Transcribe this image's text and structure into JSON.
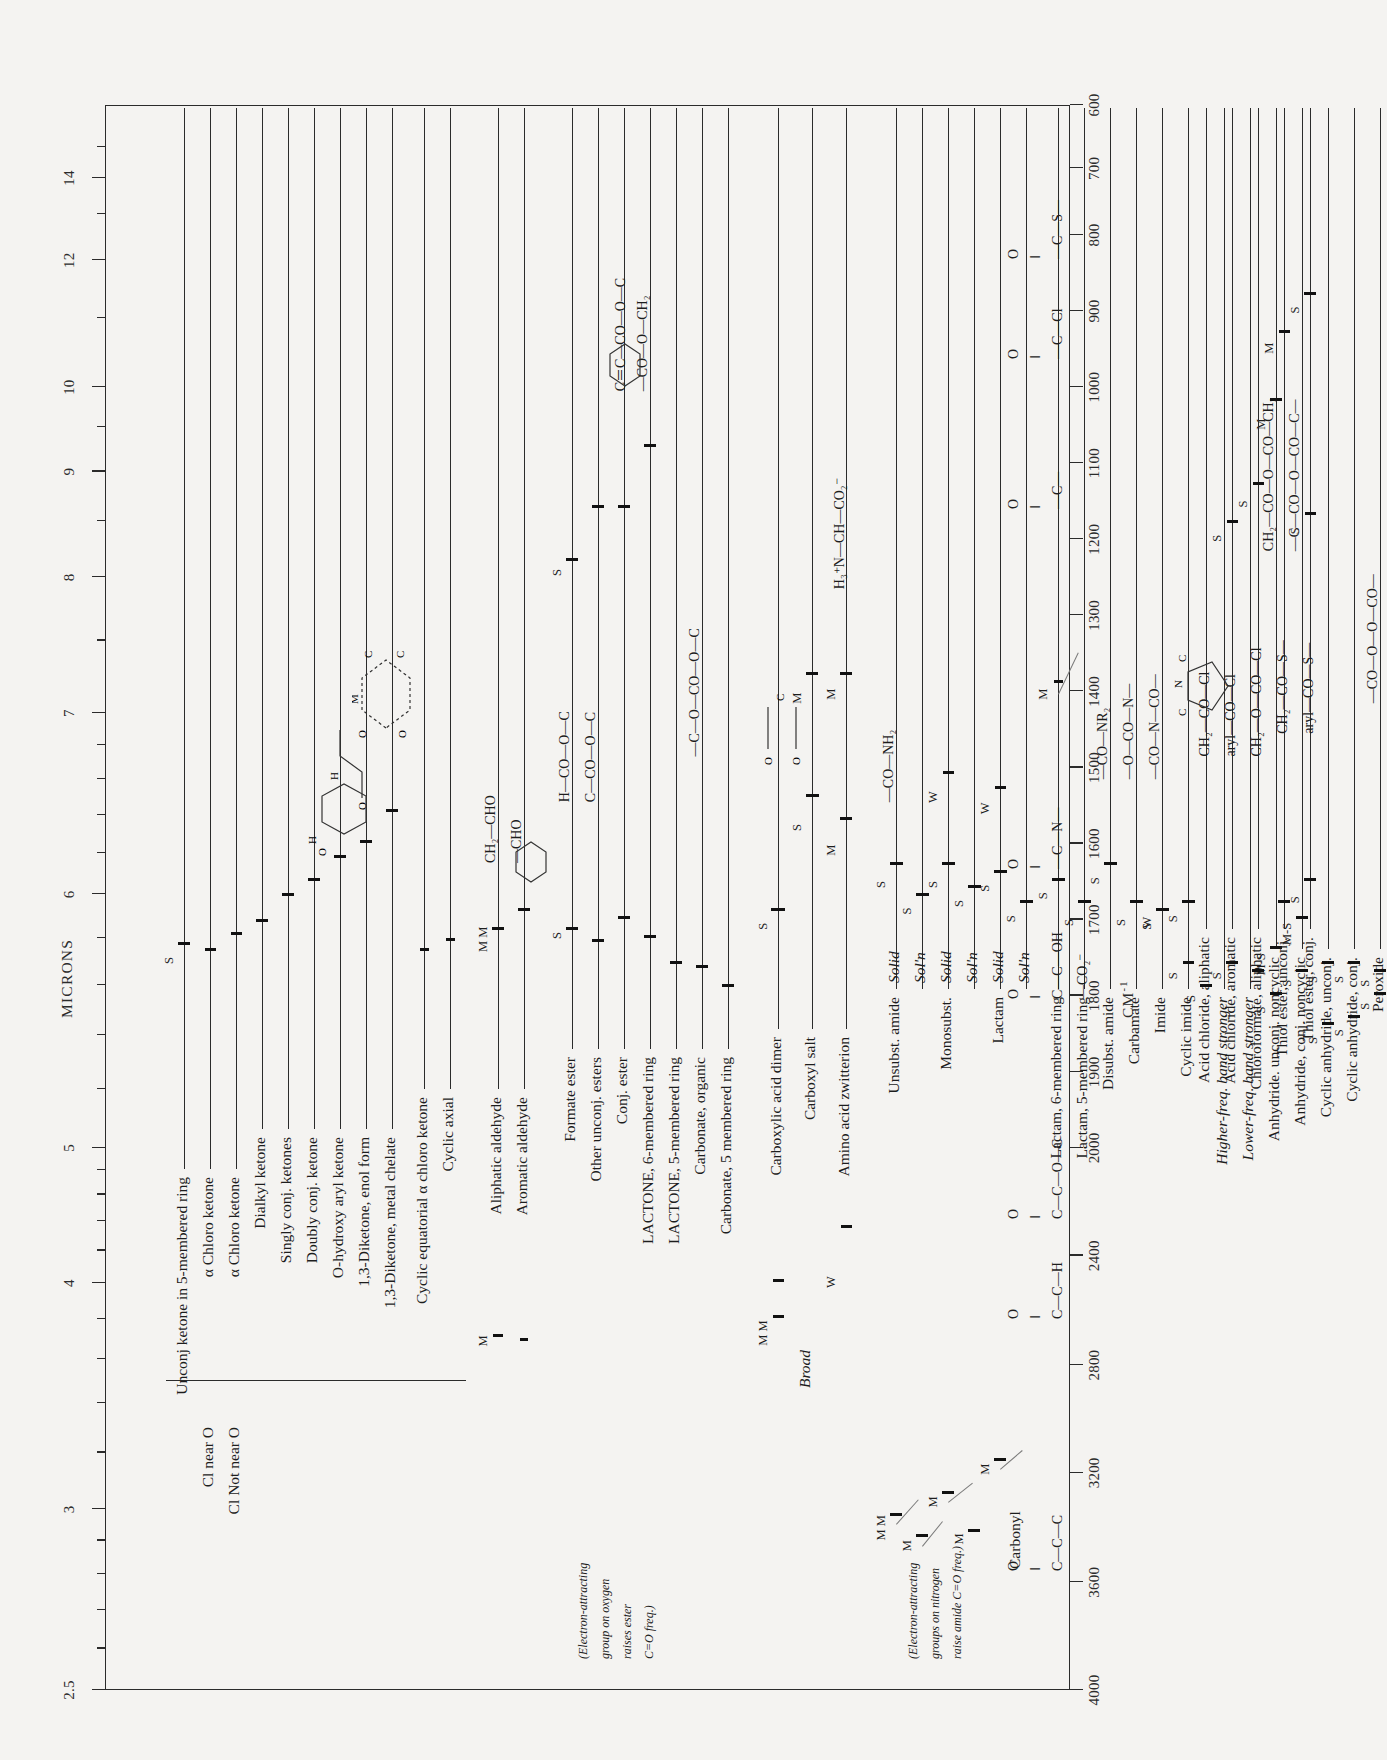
{
  "chart_data": {
    "type": "table",
    "xlabel": "CM⁻¹",
    "ylabel": "MICRONS",
    "grid": false,
    "legend": "none",
    "axes": {
      "microns": {
        "label": "MICRONS",
        "ticks": [
          "2.5",
          "3",
          "4",
          "5",
          "6",
          "7",
          "8",
          "9",
          "10",
          "12",
          "14"
        ]
      },
      "wavenumber": {
        "label": "CM⁻¹",
        "ticks": [
          "4000",
          "3600",
          "3200",
          "2800",
          "2400",
          "2000",
          "1900",
          "1800",
          "1700",
          "1600",
          "1500",
          "1400",
          "1300",
          "1200",
          "1100",
          "1000",
          "900",
          "800",
          "700",
          "600"
        ]
      }
    },
    "groups": [
      {
        "name": "ketone",
        "formula_lines": [
          "Carbonyl",
          "O",
          "‖",
          "C—C—C"
        ],
        "rows": [
          {
            "label": "Unconj ketone in 5-membered ring",
            "bands": [
              {
                "cm": 1745,
                "intensity": "S"
              }
            ]
          },
          {
            "label": "α Chloro ketone",
            "sub": "Cl near O",
            "bands": [
              {
                "cm": 1745,
                "intensity": ""
              }
            ]
          },
          {
            "label": "α Chloro ketone",
            "sub": "Cl Not near O",
            "bands": [
              {
                "cm": 1725,
                "intensity": ""
              }
            ]
          },
          {
            "label": "Dialkyl ketone",
            "bands": [
              {
                "cm": 1715,
                "intensity": ""
              }
            ]
          },
          {
            "label": "Singly conj. ketones",
            "bands": [
              {
                "cm": 1685,
                "intensity": ""
              }
            ]
          },
          {
            "label": "Doubly conj. ketone",
            "bands": [
              {
                "cm": 1665,
                "intensity": ""
              }
            ]
          },
          {
            "label": "O-hydroxy aryl ketone",
            "bands": [
              {
                "cm": 1640,
                "intensity": ""
              }
            ]
          },
          {
            "label": "1,3-Diketone, enol form",
            "bands": [
              {
                "cm": 1620,
                "intensity": ""
              }
            ]
          },
          {
            "label": "1,3-Diketone, metal chelate",
            "bands": [
              {
                "cm": 1590,
                "intensity": ""
              }
            ]
          },
          {
            "label": "Cyclic equatorial α chloro ketone",
            "bands": []
          },
          {
            "label": "Cyclic axial",
            "bands": []
          }
        ]
      },
      {
        "name": "aldehyde",
        "formula_lines": [
          "O",
          "‖",
          "C—C—H"
        ],
        "rows": [
          {
            "label": "Aliphatic aldehyde",
            "bands": [
              {
                "cm": 1725,
                "intensity": "M M"
              }
            ],
            "extra": "CH₂—CHO"
          },
          {
            "label": "Aromatic aldehyde",
            "bands": [
              {
                "cm": 1700,
                "intensity": ""
              }
            ],
            "extra": "—CHO"
          }
        ]
      },
      {
        "name": "ester",
        "formula_lines": [
          "O",
          "‖",
          "C—C—O—C"
        ],
        "note": "(Electron-attracting group on oxygen raises ester C=O freq.)",
        "rows": [
          {
            "label": "Formate ester",
            "bands": [
              {
                "cm": 1720,
                "intensity": "S"
              }
            ],
            "extra": "H—CO—O—C"
          },
          {
            "label": "Other unconj. esters",
            "bands": [
              {
                "cm": 1740,
                "intensity": ""
              }
            ],
            "extra": "C—CO—O—C"
          },
          {
            "label": "Conj. ester",
            "bands": [
              {
                "cm": 1715,
                "intensity": ""
              }
            ]
          },
          {
            "label": "LACTONE, 6-membered ring",
            "bands": [
              {
                "cm": 1735,
                "intensity": ""
              }
            ]
          },
          {
            "label": "LACTONE, 5-membered ring",
            "bands": [
              {
                "cm": 1770,
                "intensity": ""
              }
            ]
          },
          {
            "label": "Carbonate, organic",
            "bands": [
              {
                "cm": 1780,
                "intensity": ""
              }
            ],
            "extra": "—C—O—CO—O—C"
          },
          {
            "label": "Carbonate, 5 membered ring",
            "bands": [
              {
                "cm": 1800,
                "intensity": ""
              }
            ]
          },
          {
            "label": "Acetate ester C—O",
            "bands": [
              {
                "cm": 1240,
                "intensity": "S"
              }
            ]
          },
          {
            "label": "Other unconj. esters",
            "bands": [
              {
                "cm": 1190,
                "intensity": ""
              }
            ]
          },
          {
            "label": "α,β-Unsat. ester",
            "bands": [
              {
                "cm": 1180,
                "intensity": ""
              }
            ],
            "extra": "C＝C—CO—O—C"
          },
          {
            "label": "Arom. ester",
            "bands": [
              {
                "cm": 1100,
                "intensity": ""
              }
            ],
            "extra": "—CO—O—CH₂"
          }
        ]
      },
      {
        "name": "carboxylic-acid",
        "formula_lines": [
          "O",
          "‖",
          "C—C—OH",
          "—CO₂⁻"
        ],
        "rows": [
          {
            "label": "Carboxylic acid dimer",
            "bands": [
              {
                "cm": 1710,
                "intensity": "S"
              },
              {
                "cm": 2600,
                "intensity": "M M"
              },
              {
                "cm": 2900,
                "intensity": "S"
              }
            ],
            "notes": [
              "Broad"
            ]
          },
          {
            "label": "Carboxyl salt",
            "bands": [
              {
                "cm": 1580,
                "intensity": "S"
              },
              {
                "cm": 1400,
                "intensity": "M"
              }
            ]
          },
          {
            "label": "Amino acid zwitterion",
            "bands": [
              {
                "cm": 1600,
                "intensity": "M"
              },
              {
                "cm": 1400,
                "intensity": "M"
              },
              {
                "cm": 2100,
                "intensity": "W"
              }
            ],
            "extra": "H₃⁺N—CH—CO₂⁻"
          }
        ]
      },
      {
        "name": "amide",
        "formula_lines": [
          "O",
          "‖",
          "—C—N—"
        ],
        "note": "(Electron-attracting groups on nitrogen raise amide C=O freq.)",
        "rows": [
          {
            "label": "Unsubst. amide",
            "state": "Solid",
            "bands": [
              {
                "cm": 1650,
                "intensity": "S"
              },
              {
                "cm": 3350,
                "intensity": "M M"
              }
            ],
            "extra": "—CO—NH₂"
          },
          {
            "label": "Unsubst. amide",
            "state": "Sol'n",
            "bands": [
              {
                "cm": 1690,
                "intensity": "S"
              },
              {
                "cm": 3450,
                "intensity": "M"
              }
            ]
          },
          {
            "label": "Monosubst.",
            "state": "Solid",
            "bands": [
              {
                "cm": 1650,
                "intensity": "S"
              },
              {
                "cm": 3300,
                "intensity": "M"
              },
              {
                "cm": 1550,
                "intensity": "W"
              }
            ]
          },
          {
            "label": "Monosubst.",
            "state": "Sol'n",
            "bands": [
              {
                "cm": 1680,
                "intensity": "S"
              },
              {
                "cm": 3440,
                "intensity": "M"
              }
            ]
          },
          {
            "label": "Lactam (cyclic)",
            "state": "Solid",
            "bands": [
              {
                "cm": 1660,
                "intensity": "S"
              },
              {
                "cm": 3200,
                "intensity": "M"
              }
            ]
          },
          {
            "label": "Lactam (cyclic)",
            "state": "Sol'n",
            "bands": [
              {
                "cm": 1700,
                "intensity": "S"
              }
            ]
          },
          {
            "label": "Lactam, 6-membered ring",
            "bands": [
              {
                "cm": 1670,
                "intensity": "S"
              }
            ]
          },
          {
            "label": "Lactam, 5-membered ring",
            "bands": [
              {
                "cm": 1700,
                "intensity": "S"
              }
            ]
          },
          {
            "label": "Disubst. amide",
            "bands": [
              {
                "cm": 1650,
                "intensity": "S"
              }
            ],
            "extra": "—CO—NR₂"
          },
          {
            "label": "Carbamate",
            "bands": [
              {
                "cm": 1700,
                "intensity": "S"
              }
            ],
            "extra": "—O—CO—N—"
          },
          {
            "label": "Imide",
            "bands": [
              {
                "cm": 1710,
                "intensity": "S"
              },
              {
                "cm": 1700,
                "intensity": "W"
              }
            ],
            "extra": "—CO—N—CO—"
          },
          {
            "label": "Cyclic imide",
            "bands": [
              {
                "cm": 1700,
                "intensity": "S"
              },
              {
                "cm": 1770,
                "intensity": "S"
              }
            ]
          },
          {
            "label": "Higher-freq. band stronger",
            "italic": true,
            "bands": []
          },
          {
            "label": "Lower-freq. band stronger",
            "italic": true,
            "bands": []
          }
        ]
      },
      {
        "name": "anhydride",
        "formula_lines": [
          "O",
          "‖",
          "—C—O—C—",
          "‖",
          "O"
        ],
        "rows": [
          {
            "label": "Anhydride. unconj. noncyclic",
            "bands": [
              {
                "cm": 1820,
                "intensity": "S"
              },
              {
                "cm": 1760,
                "intensity": "M-S"
              },
              {
                "cm": 1050,
                "intensity": "M"
              }
            ],
            "extra": "CH₂—CO—O—CO—CH₂"
          },
          {
            "label": "Anhydride, conj. noncyclic",
            "bands": [
              {
                "cm": 1780,
                "intensity": "S"
              },
              {
                "cm": 1720,
                "intensity": "M-S"
              }
            ],
            "extra": "—C—CO—O—CO—C—"
          },
          {
            "label": "Cyclic anhydride, unconj.",
            "bands": [
              {
                "cm": 1860,
                "intensity": "S"
              },
              {
                "cm": 1780,
                "intensity": "S"
              }
            ]
          },
          {
            "label": "Cyclic anhydride, conj.",
            "bands": [
              {
                "cm": 1850,
                "intensity": "S"
              },
              {
                "cm": 1780,
                "intensity": "S"
              }
            ]
          },
          {
            "label": "Peroxide",
            "bands": [
              {
                "cm": 1810,
                "intensity": "S"
              },
              {
                "cm": 1790,
                "intensity": "S"
              }
            ],
            "extra": "—CO—O—O—CO—"
          }
        ]
      },
      {
        "name": "acid-halide-thiol",
        "formula_lines": [
          "O",
          "‖",
          "—C—Cl"
        ],
        "formula_lines2": [
          "O",
          "‖",
          "—C—S—"
        ],
        "rows": [
          {
            "label": "Acid chloride, aliphatic",
            "bands": [
              {
                "cm": 1800,
                "intensity": "S"
              }
            ],
            "extra": "CH₂—CO—Cl"
          },
          {
            "label": "Acid chloride, aromatic",
            "bands": [
              {
                "cm": 1775,
                "intensity": "S"
              },
              {
                "cm": 1200,
                "intensity": "S"
              }
            ],
            "extra": "aryl—CO—Cl"
          },
          {
            "label": "Chloroformate, aliphatic",
            "bands": [
              {
                "cm": 1780,
                "intensity": ""
              },
              {
                "cm": 1150,
                "intensity": "S"
              }
            ],
            "extra": "CH₂—O—CO—Cl"
          },
          {
            "label": "Thiol ester, unconj.",
            "bands": [
              {
                "cm": 1690,
                "intensity": ""
              },
              {
                "cm": 950,
                "intensity": "M"
              }
            ],
            "extra": "CH₂—CO—S—"
          },
          {
            "label": "Thiol ester, conj.",
            "bands": [
              {
                "cm": 1670,
                "intensity": "S"
              },
              {
                "cm": 900,
                "intensity": "S"
              },
              {
                "cm": 1190,
                "intensity": "S"
              }
            ],
            "extra": "aryl—CO—S—"
          }
        ]
      }
    ]
  },
  "axis": {
    "microns_title": "MICRONS",
    "cm_title": "CM",
    "cm_sup": "-1",
    "microns_ticks": [
      "2.5",
      "3",
      "4",
      "5",
      "6",
      "7",
      "8",
      "9",
      "10",
      "12",
      "14"
    ],
    "cm_ticks": [
      "4000",
      "3600",
      "3200",
      "2800",
      "2400",
      "2000",
      "1900",
      "1800",
      "1700",
      "1600",
      "1500",
      "1400",
      "1300",
      "1200",
      "1100",
      "1000",
      "900",
      "800",
      "700",
      "600"
    ]
  },
  "headers": {
    "carbonyl": "Carbonyl"
  },
  "labels": {
    "l001": "Unconj ketone in 5-membered ring",
    "l002": "α Chloro ketone",
    "l003": "Cl near O",
    "l004": "α Chloro ketone",
    "l005": "Cl Not near O",
    "l006": "Dialkyl ketone",
    "l007": "Singly conj. ketones",
    "l008": "Doubly conj. ketone",
    "l009": "O-hydroxy aryl ketone",
    "l010": "1,3-Diketone, enol form",
    "l011": "1,3-Diketone, metal chelate",
    "l012": "Cyclic equatorial α chloro ketone",
    "l013": "Cyclic axial",
    "l014": "Aliphatic aldehyde",
    "l015": "Aromatic aldehyde",
    "l016": "Formate ester",
    "l017": "Other unconj. esters",
    "l018": "Conj. ester",
    "l019": "LACTONE, 6-membered ring",
    "l020": "LACTONE, 5-membered ring",
    "l021": "Carbonate, organic",
    "l022": "Carbonate, 5 membered ring",
    "l023": "Acetate ester C—O",
    "l024": "Other unconj. esters",
    "l025": "α,β-Unsat. ester",
    "l026": "Arom. ester",
    "l027": "Carboxylic acid dimer",
    "l028": "Carboxyl salt",
    "l029": "Amino acid zwitterion",
    "l030": "Unsubst. amide",
    "l031": "Monosubst.",
    "l032": "Lactam",
    "l033": "(cyclic)",
    "l034": "Lactam, 6-membered ring",
    "l035": "Lactam, 5-membered ring",
    "l036": "Disubst. amide",
    "l037": "Carbamate",
    "l038": "Imide",
    "l039": "Cyclic imide",
    "l040": "Higher-freq. band stronger",
    "l041": "Lower-freq. band stronger",
    "l042": "Anhydride. unconj. noncyclic",
    "l043": "Anhydride, conj. noncyclic",
    "l044": "Cyclic anhydride, unconj.",
    "l045": "Cyclic anhydride, conj.",
    "l046": "Peroxide",
    "l047": "Acid chloride, aliphatic",
    "l048": "Acid chloride, aromatic",
    "l049": "Chloroformate, aliphatic",
    "l050": "Thiol ester, unconj.",
    "l051": "Thiol ester, conj.",
    "n001": "(Electron-attracting",
    "n002": "group on oxygen",
    "n003": "raises ester",
    "n004": "C=O freq.)",
    "n005": "(Electron-attracting",
    "n006": "groups on nitrogen",
    "n007": "raise amide C=O freq.)",
    "b001": "Broad",
    "b002": "Broad",
    "s001": "Solid",
    "s002": "Sol'n",
    "s003": "Solid",
    "s004": "Sol'n",
    "s005": "Solid",
    "s006": "Sol'n",
    "s007": "Solid",
    "s008": "Sol'n"
  },
  "structures": {
    "f_carbonyl_O": "O",
    "f_carbonyl_eq": "‖",
    "f_ketone": "C—C—C",
    "f_ald": "C—C—H",
    "f_est": "C—C—O—C",
    "f_acid": "C—C—OH",
    "f_co2": "—CO₂⁻",
    "f_amide": "—C—N—",
    "f_anh_top": "—C—",
    "f_acl": "—C—Cl",
    "f_cs": "—C—S—",
    "x001": "CH₂—CHO",
    "x002": "—CHO",
    "x003": "H—CO—O—C",
    "x004": "C—CO—O—C",
    "x005": "—C—O—CO—O—C",
    "x006": "C＝C—CO—O—C",
    "x007": "—CO—O—CH₂",
    "x008": "H₃⁺N—CH—CO₂⁻",
    "x009": "—CO—NH₂",
    "x010": "—CO—NR₂",
    "x011": "—O—CO—N—",
    "x012": "—CO—N—CO—",
    "x013": "CH₂—CO—O—CO—CH₂",
    "x014": "—C—CO—O—CO—C—",
    "x015": "—CO—O—O—CO—",
    "x016": "CH₂—CO—Cl",
    "x017": "aryl—CO—Cl",
    "x018": "CH₂—O—CO—Cl",
    "x019": "CH₂—CO—S—",
    "x020": "aryl—CO—S—",
    "x021": "—CO₂⁻"
  },
  "intensity_marks": {
    "S": "S",
    "M": "M",
    "W": "W",
    "MS": "M-S",
    "MM": "M M",
    "SS": "S S"
  }
}
